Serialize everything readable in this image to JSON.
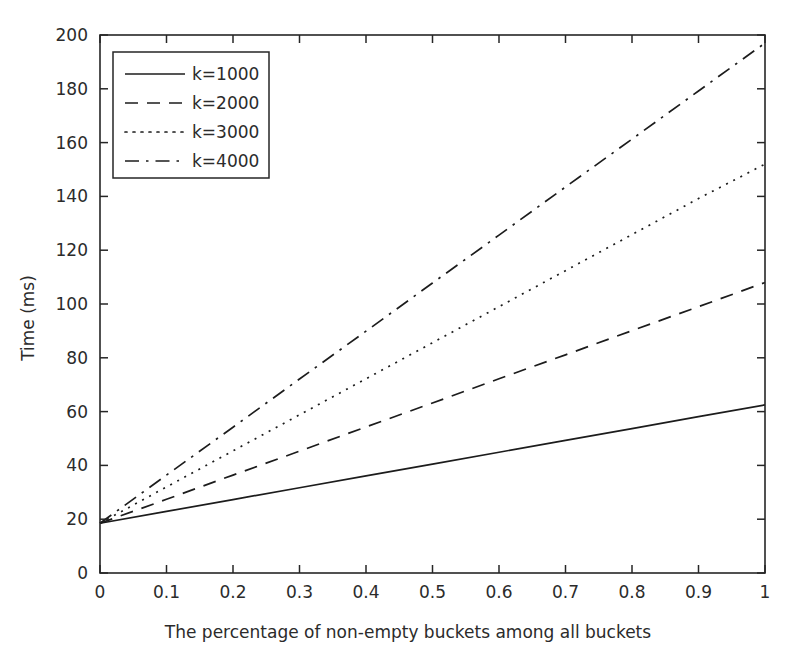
{
  "chart_data": {
    "type": "line",
    "title": "",
    "xlabel": "The percentage of non-empty buckets among all buckets",
    "ylabel": "Time (ms)",
    "xlim": [
      0,
      1
    ],
    "ylim": [
      0,
      200
    ],
    "grid": false,
    "legend_position": "upper left",
    "xticks": [
      0,
      0.1,
      0.2,
      0.3,
      0.4,
      0.5,
      0.6,
      0.7,
      0.8,
      0.9,
      1
    ],
    "xtick_labels": [
      "0",
      "0.1",
      "0.2",
      "0.3",
      "0.4",
      "0.5",
      "0.6",
      "0.7",
      "0.8",
      "0.9",
      "1"
    ],
    "yticks": [
      0,
      20,
      40,
      60,
      80,
      100,
      120,
      140,
      160,
      180,
      200
    ],
    "ytick_labels": [
      "0",
      "20",
      "40",
      "60",
      "80",
      "100",
      "120",
      "140",
      "160",
      "180",
      "200"
    ],
    "x": [
      0,
      0.1,
      0.2,
      0.3,
      0.4,
      0.5,
      0.6,
      0.7,
      0.8,
      0.9,
      1
    ],
    "series": [
      {
        "name": "k=1000",
        "style": "solid",
        "color": "#1c1c1c",
        "values": [
          18.5,
          22.9,
          27.3,
          31.7,
          36.1,
          40.5,
          44.9,
          49.3,
          53.7,
          58.1,
          62.5
        ]
      },
      {
        "name": "k=2000",
        "style": "dashed",
        "color": "#1c1c1c",
        "values": [
          18.5,
          27.4,
          36.4,
          45.3,
          54.3,
          63.2,
          72.2,
          81.1,
          90.1,
          99.0,
          108.0
        ]
      },
      {
        "name": "k=3000",
        "style": "dotted",
        "color": "#1c1c1c",
        "values": [
          18.5,
          32.0,
          45.4,
          58.8,
          72.2,
          85.6,
          99.0,
          112.4,
          125.8,
          139.2,
          152.0
        ]
      },
      {
        "name": "k=4000",
        "style": "dashdot",
        "color": "#1c1c1c",
        "values": [
          18.5,
          36.4,
          54.2,
          72.1,
          89.9,
          107.8,
          125.6,
          143.5,
          161.3,
          179.2,
          197.0
        ]
      }
    ]
  },
  "legend": {
    "entries": [
      {
        "label": "k=1000",
        "style": "solid"
      },
      {
        "label": "k=2000",
        "style": "dashed"
      },
      {
        "label": "k=3000",
        "style": "dotted"
      },
      {
        "label": "k=4000",
        "style": "dashdot"
      }
    ]
  },
  "axes": {
    "x_title": "The percentage of non-empty buckets among all buckets",
    "y_title": "Time (ms)"
  }
}
